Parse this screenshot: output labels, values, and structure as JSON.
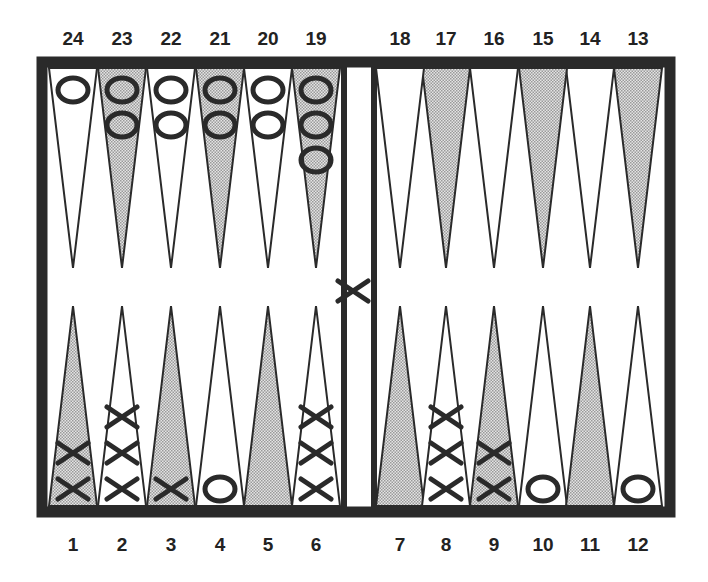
{
  "board": {
    "top_labels": [
      "24",
      "23",
      "22",
      "21",
      "20",
      "19",
      "18",
      "17",
      "16",
      "15",
      "14",
      "13"
    ],
    "bottom_labels": [
      "1",
      "2",
      "3",
      "4",
      "5",
      "6",
      "7",
      "8",
      "9",
      "10",
      "11",
      "12"
    ],
    "colors": {
      "frame": "#2a2a2a",
      "shaded_point": "#c8c8c8",
      "light_point": "#ffffff",
      "checker_ink": "#2a2a2a"
    },
    "points": [
      {
        "point": 1,
        "checker": "X",
        "count": 2,
        "shaded": true
      },
      {
        "point": 2,
        "checker": "X",
        "count": 3,
        "shaded": false
      },
      {
        "point": 3,
        "checker": "X",
        "count": 1,
        "shaded": true
      },
      {
        "point": 4,
        "checker": "O",
        "count": 1,
        "shaded": false
      },
      {
        "point": 5,
        "checker": "",
        "count": 0,
        "shaded": true
      },
      {
        "point": 6,
        "checker": "X",
        "count": 3,
        "shaded": false
      },
      {
        "point": 7,
        "checker": "",
        "count": 0,
        "shaded": true
      },
      {
        "point": 8,
        "checker": "X",
        "count": 3,
        "shaded": false
      },
      {
        "point": 9,
        "checker": "X",
        "count": 2,
        "shaded": true
      },
      {
        "point": 10,
        "checker": "O",
        "count": 1,
        "shaded": false
      },
      {
        "point": 11,
        "checker": "",
        "count": 0,
        "shaded": true
      },
      {
        "point": 12,
        "checker": "O",
        "count": 1,
        "shaded": false
      },
      {
        "point": 13,
        "checker": "",
        "count": 0,
        "shaded": true
      },
      {
        "point": 14,
        "checker": "",
        "count": 0,
        "shaded": false
      },
      {
        "point": 15,
        "checker": "",
        "count": 0,
        "shaded": true
      },
      {
        "point": 16,
        "checker": "",
        "count": 0,
        "shaded": false
      },
      {
        "point": 17,
        "checker": "",
        "count": 0,
        "shaded": true
      },
      {
        "point": 18,
        "checker": "",
        "count": 0,
        "shaded": false
      },
      {
        "point": 19,
        "checker": "O",
        "count": 3,
        "shaded": true
      },
      {
        "point": 20,
        "checker": "O",
        "count": 2,
        "shaded": false
      },
      {
        "point": 21,
        "checker": "O",
        "count": 2,
        "shaded": true
      },
      {
        "point": 22,
        "checker": "O",
        "count": 2,
        "shaded": false
      },
      {
        "point": 23,
        "checker": "O",
        "count": 2,
        "shaded": true
      },
      {
        "point": 24,
        "checker": "O",
        "count": 1,
        "shaded": false
      }
    ],
    "bar": {
      "checker": "X",
      "count": 1
    }
  }
}
